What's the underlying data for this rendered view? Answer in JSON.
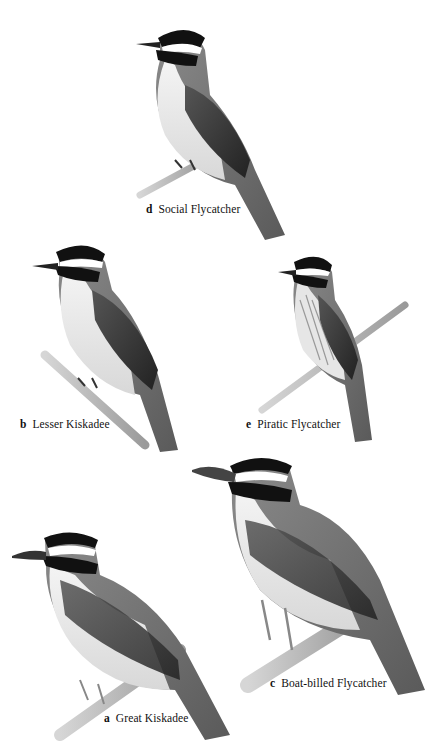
{
  "plate": {
    "background": "#ffffff",
    "birds": [
      {
        "letter": "d",
        "name": "Social Flycatcher"
      },
      {
        "letter": "b",
        "name": "Lesser Kiskadee"
      },
      {
        "letter": "e",
        "name": "Piratic Flycatcher"
      },
      {
        "letter": "c",
        "name": "Boat-billed Flycatcher"
      },
      {
        "letter": "a",
        "name": "Great Kiskadee"
      }
    ]
  }
}
